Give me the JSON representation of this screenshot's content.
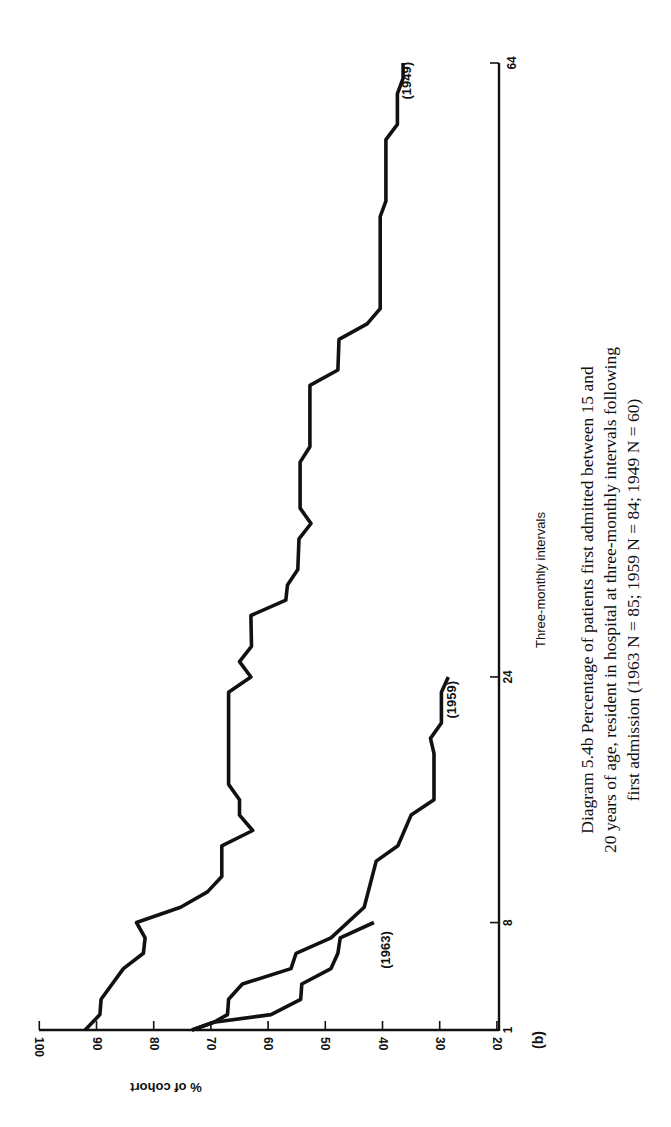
{
  "figure": {
    "panel_label": "(b)",
    "caption": {
      "line1": "Diagram 5.4b  Percentage of patients first admitted between 15 and",
      "line2": "20 years of age, resident in hospital at three-monthly intervals following",
      "line3": "first admission (1963 N = 85; 1959 N = 84; 1949 N = 60)"
    }
  },
  "chart_data": {
    "type": "line",
    "orientation": "rotated 90° clockwise (x-axis runs vertically on right, y-axis runs horizontally at bottom)",
    "xlabel": "Three-monthly intervals",
    "ylabel": "% of cohort",
    "xticks": [
      "1",
      "8",
      "24",
      "64"
    ],
    "yticks": [
      "100",
      "90",
      "80",
      "70",
      "60",
      "50",
      "40",
      "30",
      "20"
    ],
    "xlim": [
      1,
      64
    ],
    "ylim": [
      20,
      100
    ],
    "grid": false,
    "legend": "inline labels at series ends",
    "series": [
      {
        "name": "(1949)",
        "N": 60,
        "points": [
          [
            1,
            92
          ],
          [
            2,
            89.4
          ],
          [
            3,
            89.2
          ],
          [
            5,
            85.3
          ],
          [
            6,
            81.8
          ],
          [
            7,
            81.5
          ],
          [
            8,
            83
          ],
          [
            9,
            75.3
          ],
          [
            10,
            70.6
          ],
          [
            11,
            68.1
          ],
          [
            13,
            68.1
          ],
          [
            14,
            62.7
          ],
          [
            15,
            65
          ],
          [
            16,
            65
          ],
          [
            17,
            66.9
          ],
          [
            23,
            66.9
          ],
          [
            24,
            63
          ],
          [
            25,
            65
          ],
          [
            26,
            62.9
          ],
          [
            28,
            63
          ],
          [
            29,
            56.9
          ],
          [
            30,
            56.6
          ],
          [
            31,
            54.8
          ],
          [
            33,
            54.6
          ],
          [
            34,
            52.5
          ],
          [
            35,
            54.4
          ],
          [
            38,
            54.4
          ],
          [
            39,
            52.7
          ],
          [
            43,
            52.7
          ],
          [
            44,
            47.8
          ],
          [
            46,
            47.6
          ],
          [
            47,
            42.7
          ],
          [
            48,
            40.4
          ],
          [
            54,
            40.4
          ],
          [
            55,
            39.4
          ],
          [
            59,
            39.4
          ],
          [
            60,
            37.4
          ],
          [
            62,
            37.4
          ],
          [
            63,
            36.4
          ],
          [
            64,
            36.4
          ]
        ]
      },
      {
        "name": "(1959)",
        "N": 84,
        "points": [
          [
            1,
            73.3
          ],
          [
            1.5,
            69.5
          ],
          [
            2,
            67.1
          ],
          [
            3,
            66.9
          ],
          [
            4,
            64.5
          ],
          [
            5,
            56
          ],
          [
            6,
            55.1
          ],
          [
            7,
            49
          ],
          [
            9,
            43.2
          ],
          [
            12,
            41.1
          ],
          [
            13,
            37.3
          ],
          [
            15,
            35
          ],
          [
            16,
            31
          ],
          [
            19,
            31
          ],
          [
            20,
            31.6
          ],
          [
            21,
            29.7
          ],
          [
            23,
            29.7
          ],
          [
            24,
            28.5
          ]
        ]
      },
      {
        "name": "(1963)",
        "N": 85,
        "points": [
          [
            1,
            73.3
          ],
          [
            1.5,
            69.5
          ],
          [
            2,
            59.5
          ],
          [
            3,
            54.3
          ],
          [
            4,
            54.1
          ],
          [
            5,
            49
          ],
          [
            6,
            47.8
          ],
          [
            7,
            47.4
          ],
          [
            8,
            41.5
          ]
        ]
      }
    ]
  }
}
